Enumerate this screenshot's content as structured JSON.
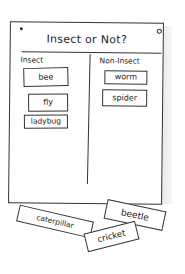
{
  "board": {
    "title": "Insect or Not?",
    "columns": [
      {
        "heading": "Insect",
        "cards": [
          "bee",
          "fly",
          "ladybug"
        ]
      },
      {
        "heading": "Non-Insect",
        "cards": [
          "worm",
          "spider"
        ]
      }
    ]
  },
  "loose_cards": [
    "beetle",
    "caterpillar",
    "cricket"
  ]
}
